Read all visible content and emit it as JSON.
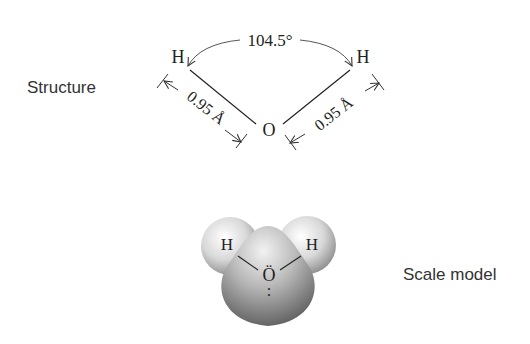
{
  "structure": {
    "label": "Structure",
    "atoms": {
      "left_hydrogen": "H",
      "right_hydrogen": "H",
      "oxygen": "O"
    },
    "bond_angle": "104.5°",
    "bond_length_left": "0.95 Å",
    "bond_length_right": "0.95 Å"
  },
  "scale_model": {
    "label": "Scale model",
    "atoms": {
      "left_hydrogen": "H",
      "right_hydrogen": "H",
      "oxygen": "Ö"
    },
    "lone_pairs": ":",
    "colors": {
      "hydrogen_light": "#f4f4f4",
      "hydrogen_dark": "#9a9a9a",
      "oxygen_light": "#e8e8e8",
      "oxygen_dark": "#6a6a6a"
    }
  }
}
